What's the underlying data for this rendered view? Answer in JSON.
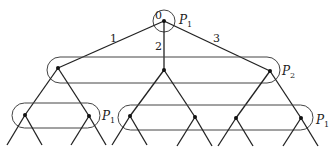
{
  "diagram": {
    "type": "game-tree",
    "root": {
      "label": "0",
      "player": "P",
      "player_sub": "1"
    },
    "edges_from_root": [
      {
        "label": "1"
      },
      {
        "label": "2"
      },
      {
        "label": "3"
      }
    ],
    "info_sets": [
      {
        "id": "level1",
        "player": "P",
        "player_sub": "2"
      },
      {
        "id": "level2-left",
        "player": "P",
        "player_sub": "1"
      },
      {
        "id": "level2-right",
        "player": "P",
        "player_sub": "1"
      }
    ]
  }
}
